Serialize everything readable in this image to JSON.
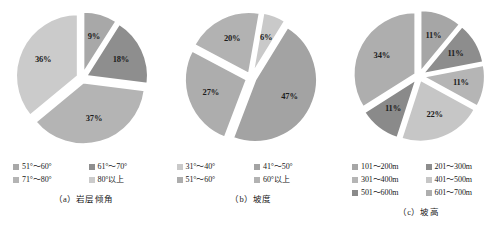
{
  "figure": {
    "background": "#ffffff",
    "panel_count": 3
  },
  "chart_data": [
    {
      "type": "pie",
      "id": "a",
      "title": "",
      "caption": "（a）岩层倾角",
      "exploded": true,
      "legend_position": "bottom",
      "legend_columns": 2,
      "categories": [
        "51°～60°",
        "61°～70°",
        "71°～80°",
        "80°以上"
      ],
      "values": [
        9,
        18,
        37,
        36
      ],
      "labels": [
        "9%",
        "18%",
        "37%",
        "36%"
      ],
      "colors": [
        "#a8a8a8",
        "#8e8e8e",
        "#b4b4b4",
        "#cbcbcb"
      ],
      "unit": "%"
    },
    {
      "type": "pie",
      "id": "b",
      "title": "",
      "caption": "（b）坡度",
      "exploded": true,
      "legend_position": "bottom",
      "legend_columns": 2,
      "categories": [
        "31°～40°",
        "41°～50°",
        "51°～60°",
        "60°以上"
      ],
      "values": [
        6,
        47,
        27,
        20
      ],
      "labels": [
        "6%",
        "47%",
        "27%",
        "20%"
      ],
      "colors": [
        "#c9c9c9",
        "#a3a3a3",
        "#adadad",
        "#b2b2b2"
      ],
      "unit": "%"
    },
    {
      "type": "pie",
      "id": "c",
      "title": "",
      "caption": "（c）坡高",
      "exploded": true,
      "legend_position": "bottom",
      "legend_columns": 2,
      "categories": [
        "101～200m",
        "201～300m",
        "301～400m",
        "401～500m",
        "501～600m",
        "601～700m"
      ],
      "values": [
        11,
        11,
        11,
        22,
        11,
        34
      ],
      "labels": [
        "11%",
        "11%",
        "11%",
        "22%",
        "11%",
        "34%"
      ],
      "colors": [
        "#a6a6a6",
        "#8d8d8d",
        "#b5b5b5",
        "#c6c6c6",
        "#8a8a8a",
        "#aeaeae"
      ],
      "unit": "%"
    }
  ]
}
